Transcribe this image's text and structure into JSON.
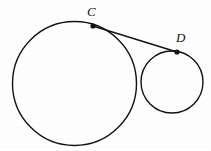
{
  "figure": {
    "kind": "geometry-diagram",
    "background_color": "#fefefe",
    "stroke_color": "#111111",
    "canvas": {
      "width": 211,
      "height": 151
    }
  },
  "shapes": {
    "large_circle": {
      "name": "large-circle",
      "cx": 74.5,
      "cy": 83.5,
      "r": 62,
      "stroke_width": 1.4
    },
    "small_circle": {
      "name": "small-circle",
      "cx": 172,
      "cy": 82,
      "r": 31,
      "stroke_width": 1.4
    },
    "tangent_segment": {
      "name": "segment-CD",
      "x1": 93,
      "y1": 26,
      "x2": 177,
      "y2": 52,
      "stroke_width": 1.4
    }
  },
  "points": [
    {
      "id": "C",
      "label": "C",
      "x": 93,
      "y": 26,
      "dot_radius": 2.6,
      "label_x": 87,
      "label_y": 5
    },
    {
      "id": "D",
      "label": "D",
      "x": 177,
      "y": 52,
      "dot_radius": 2.6,
      "label_x": 176,
      "label_y": 31
    }
  ]
}
